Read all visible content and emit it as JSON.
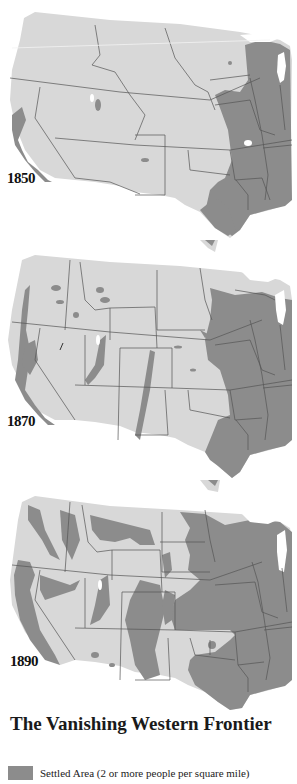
{
  "colors": {
    "land": "#d8d8d8",
    "settled": "#8c8c8c",
    "border": "#555555",
    "water": "#ffffff"
  },
  "maps": [
    {
      "year": "1850"
    },
    {
      "year": "1870"
    },
    {
      "year": "1890"
    }
  ],
  "title": "The Vanishing Western Frontier",
  "legend": {
    "items": [
      {
        "label": "Settled Area (2 or more people per square mile)",
        "color": "#8c8c8c"
      }
    ]
  }
}
